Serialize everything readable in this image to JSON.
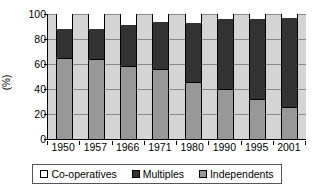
{
  "chart_data": {
    "type": "bar",
    "subtype": "stacked-percentage",
    "title": "",
    "xlabel": "",
    "ylabel": "(%)",
    "ylim": [
      0,
      100
    ],
    "yticks": [
      0,
      20,
      40,
      60,
      80,
      100
    ],
    "ytick_labels": [
      "0",
      "20",
      "40",
      "60",
      "80",
      "100"
    ],
    "grid": true,
    "grid_axis": "y",
    "legend_position": "bottom",
    "categories": [
      "1950",
      "1957",
      "1966",
      "1971",
      "1980",
      "1990",
      "1995",
      "2001"
    ],
    "series": [
      {
        "name": "Independents",
        "color": "#989898",
        "values": [
          64,
          63,
          58,
          55,
          45,
          39,
          31,
          25
        ]
      },
      {
        "name": "Multiples",
        "color": "#333333",
        "values": [
          24,
          25,
          33,
          39,
          48,
          57,
          65,
          72
        ]
      },
      {
        "name": "Co-operatives",
        "color": "#ffffff",
        "values": [
          12,
          12,
          9,
          6,
          7,
          4,
          4,
          3
        ]
      }
    ],
    "stack_order_bottom_to_top": [
      "Independents",
      "Multiples",
      "Co-operatives"
    ],
    "plot_background": "#d4d4d4"
  },
  "axis": {
    "y_title": "(%)",
    "y_tick_labels": [
      "100",
      "80",
      "60",
      "40",
      "20",
      "0"
    ],
    "x_tick_labels": [
      "1950",
      "1957",
      "1966",
      "1971",
      "1980",
      "1990",
      "1995",
      "2001"
    ]
  },
  "legend": {
    "items": [
      {
        "label": "Co-operatives",
        "color": "#ffffff"
      },
      {
        "label": "Multiples",
        "color": "#333333"
      },
      {
        "label": "Independents",
        "color": "#989898"
      }
    ]
  }
}
